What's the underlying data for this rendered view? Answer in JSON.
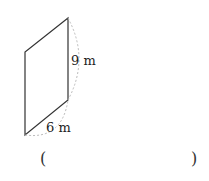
{
  "figure": {
    "shape": "parallelogram",
    "vertices": [
      [
        68,
        18
      ],
      [
        25,
        52
      ],
      [
        25,
        135
      ],
      [
        68,
        100
      ]
    ],
    "side_label_vertical": "9 m",
    "side_label_slanted": "6 m",
    "stroke_color": "#333333",
    "dashed_color": "#bbbbbb"
  },
  "answer": {
    "open_paren": "(",
    "close_paren": ")",
    "value": ""
  }
}
